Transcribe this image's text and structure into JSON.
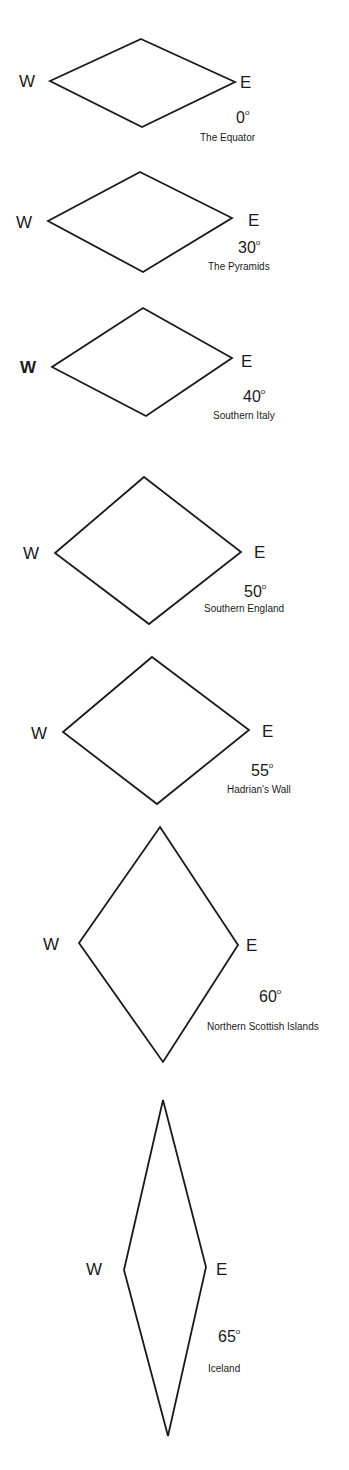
{
  "diagram": {
    "direction_labels": {
      "west": "W",
      "east": "E"
    },
    "degree_symbol": "o",
    "stroke_color": "#1a1a1a",
    "background": "#ffffff",
    "cells": [
      {
        "latitude": "0",
        "place": "The Equator",
        "top": [
          141,
          39
        ],
        "left": [
          50,
          81
        ],
        "right": [
          235,
          82
        ],
        "bottom": [
          142,
          127
        ],
        "w_pos": [
          19,
          73
        ],
        "e_pos": [
          240,
          74
        ],
        "deg_pos": [
          236,
          110
        ],
        "place_pos": [
          200,
          133
        ],
        "w_bold": false
      },
      {
        "latitude": "30",
        "place": "The Pyramids",
        "top": [
          140,
          172
        ],
        "left": [
          48,
          221
        ],
        "right": [
          232,
          218
        ],
        "bottom": [
          143,
          272
        ],
        "w_pos": [
          16,
          214
        ],
        "e_pos": [
          248,
          212
        ],
        "deg_pos": [
          238,
          240
        ],
        "place_pos": [
          208,
          262
        ],
        "w_bold": false
      },
      {
        "latitude": "40",
        "place": "Southern Italy",
        "top": [
          143,
          308
        ],
        "left": [
          52,
          367
        ],
        "right": [
          232,
          358
        ],
        "bottom": [
          146,
          416
        ],
        "w_pos": [
          20,
          359
        ],
        "e_pos": [
          241,
          353
        ],
        "deg_pos": [
          243,
          389
        ],
        "place_pos": [
          213,
          411
        ],
        "w_bold": true
      },
      {
        "latitude": "50",
        "place": "Southern England",
        "top": [
          144,
          477
        ],
        "left": [
          55,
          553
        ],
        "right": [
          241,
          552
        ],
        "bottom": [
          149,
          624
        ],
        "w_pos": [
          23,
          545
        ],
        "e_pos": [
          254,
          544
        ],
        "deg_pos": [
          244,
          584
        ],
        "place_pos": [
          204,
          604
        ],
        "w_bold": false
      },
      {
        "latitude": "55",
        "place": "Hadrian's Wall",
        "top": [
          152,
          657
        ],
        "left": [
          63,
          732
        ],
        "right": [
          249,
          730
        ],
        "bottom": [
          157,
          804
        ],
        "w_pos": [
          31,
          725
        ],
        "e_pos": [
          262,
          723
        ],
        "deg_pos": [
          251,
          763
        ],
        "place_pos": [
          227,
          785
        ],
        "w_bold": false
      },
      {
        "latitude": "60",
        "place": "Northern Scottish Islands",
        "top": [
          160,
          827
        ],
        "left": [
          79,
          943
        ],
        "right": [
          238,
          945
        ],
        "bottom": [
          163,
          1062
        ],
        "w_pos": [
          43,
          936
        ],
        "e_pos": [
          246,
          937
        ],
        "deg_pos": [
          259,
          989
        ],
        "place_pos": [
          207,
          1022
        ],
        "w_bold": false
      },
      {
        "latitude": "65",
        "place": "Iceland",
        "top": [
          163,
          1100
        ],
        "left": [
          124,
          1270
        ],
        "right": [
          206,
          1267
        ],
        "bottom": [
          168,
          1436
        ],
        "w_pos": [
          86,
          1261
        ],
        "e_pos": [
          216,
          1261
        ],
        "deg_pos": [
          218,
          1329
        ],
        "place_pos": [
          208,
          1364
        ],
        "w_bold": false
      }
    ]
  }
}
